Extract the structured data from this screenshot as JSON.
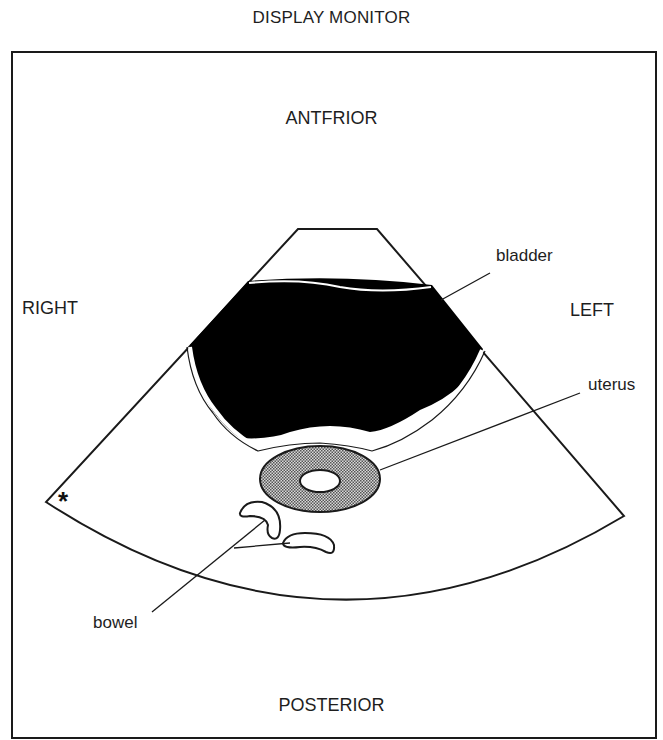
{
  "title": "DISPLAY MONITOR",
  "orientation": {
    "top": "ANTFRIOR",
    "bottom": "POSTERIOR",
    "left_side": "RIGHT",
    "right_side": "LEFT"
  },
  "structures": {
    "bladder": "bladder",
    "uterus": "uterus",
    "bowel": "bowel"
  },
  "marker": "*",
  "colors": {
    "line": "#1a1a1a",
    "bladder_fill": "#000000",
    "uterus_fill": "#9a9a9a",
    "background": "#ffffff"
  }
}
